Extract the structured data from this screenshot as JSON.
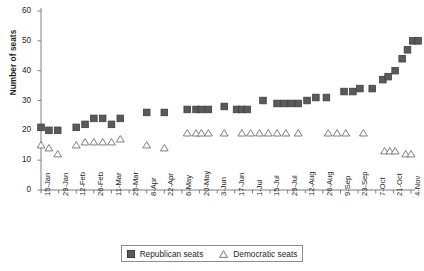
{
  "chart_data": {
    "type": "scatter",
    "title": "",
    "xlabel": "",
    "ylabel": "Number of seats",
    "ylim": [
      0,
      60
    ],
    "yticks": [
      0,
      10,
      20,
      30,
      40,
      50,
      60
    ],
    "grid": false,
    "legend_position": "bottom-center",
    "categories": [
      "15-Jan",
      "29-Jan",
      "12-Feb",
      "26-Feb",
      "11-Mar",
      "25-Mar",
      "8-Apr",
      "22-Apr",
      "6-May",
      "20-May",
      "3-Jun",
      "17-Jun",
      "1-Jul",
      "15-Jul",
      "29-Jul",
      "12-Aug",
      "26-Aug",
      "9-Sep",
      "23-Sep",
      "7-Oct",
      "21-Oct",
      "4-Nov"
    ],
    "series": [
      {
        "name": "Republican seats",
        "marker": "filled-square",
        "color": "#5a5a5a",
        "points": [
          {
            "x": 0.0,
            "y": 21
          },
          {
            "x": 0.45,
            "y": 20
          },
          {
            "x": 0.95,
            "y": 20
          },
          {
            "x": 2.0,
            "y": 21
          },
          {
            "x": 2.5,
            "y": 22
          },
          {
            "x": 3.0,
            "y": 24
          },
          {
            "x": 3.5,
            "y": 24
          },
          {
            "x": 4.0,
            "y": 22
          },
          {
            "x": 4.5,
            "y": 24
          },
          {
            "x": 6.0,
            "y": 26
          },
          {
            "x": 7.0,
            "y": 26
          },
          {
            "x": 8.3,
            "y": 27
          },
          {
            "x": 8.8,
            "y": 27
          },
          {
            "x": 9.1,
            "y": 27
          },
          {
            "x": 9.5,
            "y": 27
          },
          {
            "x": 10.4,
            "y": 28
          },
          {
            "x": 11.1,
            "y": 27
          },
          {
            "x": 11.4,
            "y": 27
          },
          {
            "x": 11.7,
            "y": 27
          },
          {
            "x": 12.6,
            "y": 30
          },
          {
            "x": 13.4,
            "y": 29
          },
          {
            "x": 13.8,
            "y": 29
          },
          {
            "x": 14.2,
            "y": 29
          },
          {
            "x": 14.6,
            "y": 29
          },
          {
            "x": 15.1,
            "y": 30
          },
          {
            "x": 15.6,
            "y": 31
          },
          {
            "x": 16.2,
            "y": 31
          },
          {
            "x": 17.2,
            "y": 33
          },
          {
            "x": 17.7,
            "y": 33
          },
          {
            "x": 18.1,
            "y": 34
          },
          {
            "x": 18.8,
            "y": 34
          },
          {
            "x": 19.4,
            "y": 37
          },
          {
            "x": 19.7,
            "y": 38
          },
          {
            "x": 20.1,
            "y": 40
          },
          {
            "x": 20.5,
            "y": 44
          },
          {
            "x": 20.8,
            "y": 47
          },
          {
            "x": 21.1,
            "y": 50
          },
          {
            "x": 21.4,
            "y": 50
          }
        ]
      },
      {
        "name": "Democratic seats",
        "marker": "open-triangle",
        "color": "#ffffff",
        "points": [
          {
            "x": 0.0,
            "y": 15
          },
          {
            "x": 0.45,
            "y": 14
          },
          {
            "x": 0.95,
            "y": 12
          },
          {
            "x": 2.0,
            "y": 15
          },
          {
            "x": 2.5,
            "y": 16
          },
          {
            "x": 3.0,
            "y": 16
          },
          {
            "x": 3.5,
            "y": 16
          },
          {
            "x": 4.0,
            "y": 16
          },
          {
            "x": 4.5,
            "y": 17
          },
          {
            "x": 6.0,
            "y": 15
          },
          {
            "x": 7.0,
            "y": 14
          },
          {
            "x": 8.3,
            "y": 19
          },
          {
            "x": 8.8,
            "y": 19
          },
          {
            "x": 9.1,
            "y": 19
          },
          {
            "x": 9.5,
            "y": 19
          },
          {
            "x": 10.4,
            "y": 19
          },
          {
            "x": 11.4,
            "y": 19
          },
          {
            "x": 11.9,
            "y": 19
          },
          {
            "x": 12.4,
            "y": 19
          },
          {
            "x": 12.9,
            "y": 19
          },
          {
            "x": 13.4,
            "y": 19
          },
          {
            "x": 13.9,
            "y": 19
          },
          {
            "x": 14.6,
            "y": 19
          },
          {
            "x": 16.3,
            "y": 19
          },
          {
            "x": 16.8,
            "y": 19
          },
          {
            "x": 17.3,
            "y": 19
          },
          {
            "x": 18.3,
            "y": 19
          },
          {
            "x": 19.5,
            "y": 13
          },
          {
            "x": 19.8,
            "y": 13
          },
          {
            "x": 20.1,
            "y": 13
          },
          {
            "x": 20.7,
            "y": 12
          },
          {
            "x": 21.0,
            "y": 12
          }
        ]
      }
    ],
    "legend": [
      {
        "label": "Republican seats",
        "marker": "filled-square"
      },
      {
        "label": "Democratic seats",
        "marker": "open-triangle"
      }
    ]
  }
}
